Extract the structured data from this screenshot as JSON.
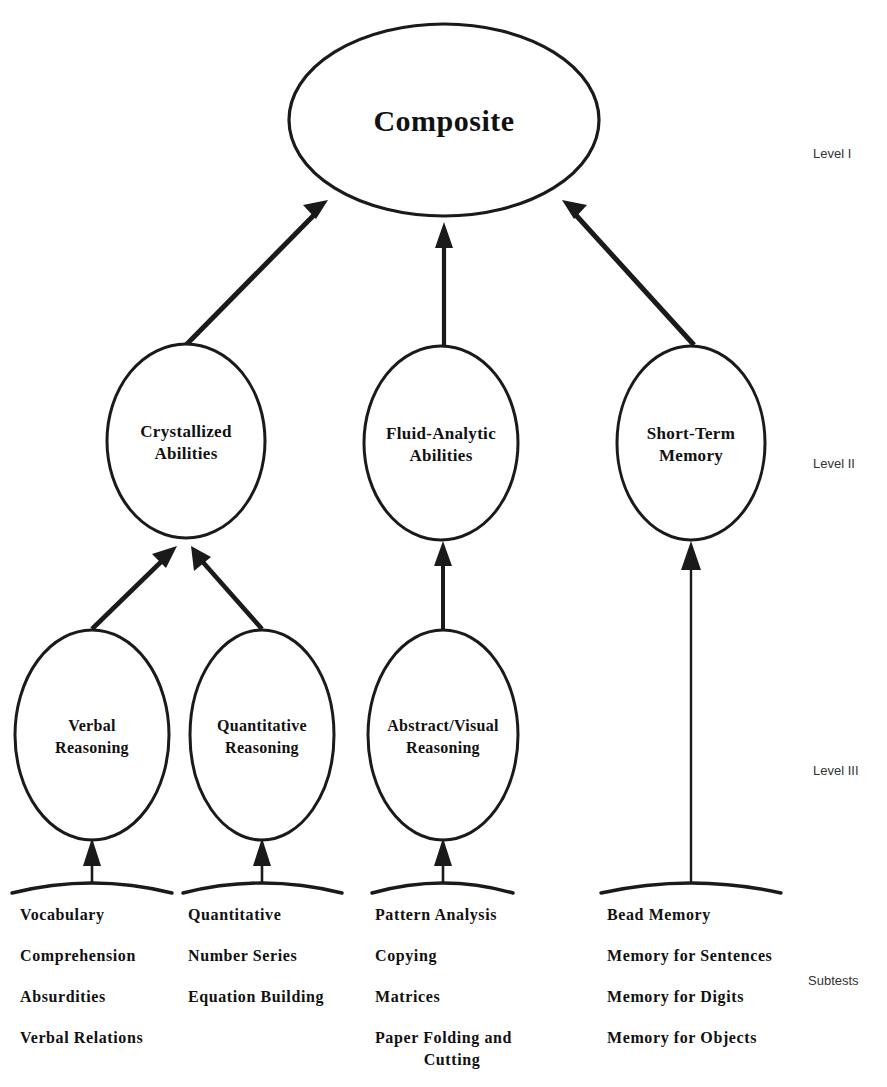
{
  "figure": {
    "type": "hierarchical-model-diagram",
    "background_color": "#ffffff",
    "line_color": "#1a1a1a",
    "text_color": "#111111"
  },
  "levels": {
    "level1_label": "Level I",
    "level2_label": "Level II",
    "level3_label": "Level III",
    "subtests_label": "Subtests"
  },
  "level1": {
    "node": {
      "name": "composite",
      "label": "Composite"
    }
  },
  "level2": {
    "nodes": [
      {
        "name": "crystallized-abilities",
        "line1": "Crystallized",
        "line2": "Abilities"
      },
      {
        "name": "fluid-analytic-abilities",
        "line1": "Fluid-Analytic",
        "line2": "Abilities"
      },
      {
        "name": "short-term-memory",
        "line1": "Short-Term",
        "line2": "Memory"
      }
    ]
  },
  "level3": {
    "nodes": [
      {
        "name": "verbal-reasoning",
        "line1": "Verbal",
        "line2": "Reasoning"
      },
      {
        "name": "quantitative-reasoning",
        "line1": "Quantitative",
        "line2": "Reasoning"
      },
      {
        "name": "abstract-visual-reasoning",
        "line1": "Abstract/Visual",
        "line2": "Reasoning"
      }
    ]
  },
  "subtests": {
    "groups": [
      {
        "name": "verbal-reasoning-subtests",
        "items": [
          "Vocabulary",
          "Comprehension",
          "Absurdities",
          "Verbal Relations"
        ]
      },
      {
        "name": "quantitative-reasoning-subtests",
        "items": [
          "Quantitative",
          "Number Series",
          "Equation Building"
        ]
      },
      {
        "name": "abstract-visual-reasoning-subtests",
        "items": [
          "Pattern Analysis",
          "Copying",
          "Matrices",
          "Paper Folding and",
          "Cutting"
        ]
      },
      {
        "name": "short-term-memory-subtests",
        "items": [
          "Bead Memory",
          "Memory for Sentences",
          "Memory for Digits",
          "Memory for Objects"
        ]
      }
    ]
  }
}
